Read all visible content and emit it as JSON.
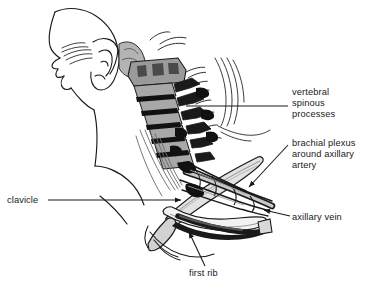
{
  "figure": {
    "type": "anatomical-illustration",
    "view": "left lateral",
    "background_color": "#ffffff",
    "line_color": "#1a1a1a",
    "shading_colors": [
      "#000000",
      "#4a4a4a",
      "#8a8a8a",
      "#b8b8b8",
      "#d8d8d8"
    ]
  },
  "labels": [
    {
      "id": "vertebral-spinous-processes",
      "text": "vertebral\nspinous\nprocesses",
      "leader": "horizontal-line",
      "leader_side": "left",
      "target_x": 186,
      "target_y": 106
    },
    {
      "id": "brachial-plexus-around-axillary-artery",
      "text": "brachial plexus\naround axillary\nartery",
      "leader": "arrow",
      "leader_side": "left",
      "target_x": 247,
      "target_y": 189
    },
    {
      "id": "axillary-vein",
      "text": "axillary vein",
      "leader": "arrow",
      "leader_side": "left",
      "target_x": 262,
      "target_y": 209
    },
    {
      "id": "clavicle",
      "text": "clavicle",
      "leader": "arrow",
      "leader_side": "right",
      "target_x": 183,
      "target_y": 200
    },
    {
      "id": "first-rib",
      "text": "first rib",
      "leader": "arrow",
      "leader_side": "up-left",
      "target_x": 188,
      "target_y": 231
    }
  ]
}
